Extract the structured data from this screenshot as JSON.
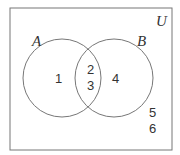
{
  "diagram": {
    "type": "venn",
    "universe_label": "U",
    "sets": [
      {
        "label": "A"
      },
      {
        "label": "B"
      }
    ],
    "regions": {
      "A_only": [
        "1"
      ],
      "A_and_B": [
        "2",
        "3"
      ],
      "B_only": [
        "4"
      ],
      "outside": [
        "5",
        "6"
      ]
    }
  }
}
